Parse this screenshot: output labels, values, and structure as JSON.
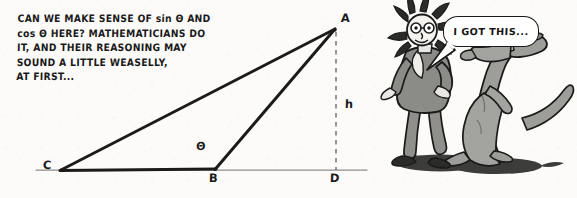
{
  "page": {
    "background_color": "#fcfbf9",
    "ink_color": "#1a1a1a"
  },
  "caption": {
    "lines": [
      "CAN WE MAKE SENSE OF sin Θ AND",
      "cos Θ HERE? MATHEMATICIANS DO",
      "IT, AND THEIR REASONING MAY",
      "SOUND A LITTLE WEASELLY,",
      "AT FIRST..."
    ]
  },
  "diagram": {
    "type": "geometry-figure",
    "labels": {
      "apex": "A",
      "left_vertex": "C",
      "middle_vertex": "B",
      "foot_of_altitude": "D",
      "altitude": "h",
      "angle": "Θ"
    },
    "points": {
      "A": [
        335,
        29
      ],
      "B": [
        215,
        169
      ],
      "C": [
        61,
        170
      ],
      "D": [
        336,
        170
      ]
    },
    "segments": [
      {
        "name": "CA",
        "from": "C",
        "to": "A",
        "style": "solid-thick"
      },
      {
        "name": "CB",
        "from": "C",
        "to": "B",
        "style": "solid-thick"
      },
      {
        "name": "BA",
        "from": "B",
        "to": "A",
        "style": "solid-thick"
      },
      {
        "name": "AD",
        "from": "A",
        "to": "D",
        "style": "dashed"
      },
      {
        "name": "baseline",
        "from": [
          36,
          170
        ],
        "to": [
          367,
          170
        ],
        "style": "thin-gray"
      }
    ]
  },
  "cartoon": {
    "characters": [
      {
        "name": "person",
        "description": "cartoon person with wild hair wearing a gray suit"
      },
      {
        "name": "weasel",
        "description": "weasel standing upright with long tail, paw on person's shoulder"
      }
    ],
    "speech_bubble": {
      "text": "I GOT THIS...",
      "speaker": "weasel"
    },
    "colors": {
      "fur": "#9a9a96",
      "suit": "#8e8e8a",
      "shadow": "#3a3a38",
      "outline": "#1a1a1a"
    }
  }
}
